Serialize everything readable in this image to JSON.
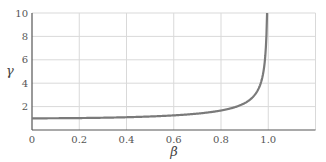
{
  "chart_data": {
    "type": "line",
    "title": "",
    "xlabel": "β",
    "ylabel": "γ",
    "xlim": [
      0,
      1.2
    ],
    "ylim": [
      0,
      10
    ],
    "x_ticks": [
      0,
      0.2,
      0.4,
      0.6,
      0.8,
      1.0
    ],
    "x_tick_labels": [
      "0",
      "0.2",
      "0.4",
      "0.6",
      "0.8",
      "1.0"
    ],
    "y_ticks": [
      2,
      4,
      6,
      8,
      10
    ],
    "y_tick_labels": [
      "2",
      "4",
      "6",
      "8",
      "10"
    ],
    "grid": true,
    "legend": null,
    "series": [
      {
        "name": "γ = 1/√(1−β²)",
        "color": "#7a7a7a",
        "x": [
          0,
          0.2,
          0.4,
          0.6,
          0.8,
          0.85,
          0.9,
          0.95,
          0.98,
          0.99,
          0.995
        ],
        "y": [
          1.0,
          1.02,
          1.09,
          1.25,
          1.67,
          1.9,
          2.29,
          3.2,
          5.03,
          7.09,
          10.0
        ]
      }
    ]
  },
  "colors": {
    "grid": "#d9d9d9",
    "axis": "#555555",
    "curve": "#7a7a7a"
  }
}
